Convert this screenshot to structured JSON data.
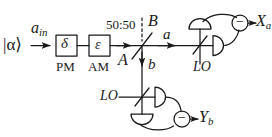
{
  "figure": {
    "type": "optical-schematic",
    "stroke_color": "#1a1a1a",
    "background": "#ffffff"
  },
  "labels": {
    "input_state": "|α⟩",
    "input_mode": "a",
    "input_mode_sub": "in",
    "pm_symbol": "δ",
    "pm_caption": "PM",
    "am_symbol": "ε",
    "am_caption": "AM",
    "beamsplitter_ratio": "50:50",
    "port_a_in": "A",
    "port_b_in": "B",
    "output_a": "a",
    "output_b": "b",
    "lo_top": "LO",
    "lo_bottom": "LO",
    "detector_sign_top": "−",
    "detector_sign_bottom": "−",
    "output_top": "X",
    "output_top_sub": "a",
    "output_bottom": "Y",
    "output_bottom_sub": "b"
  }
}
